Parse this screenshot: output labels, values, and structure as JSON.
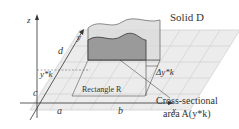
{
  "diagram": {
    "title": "Solid D",
    "axes": {
      "z": "z",
      "y": "y",
      "x": "x"
    },
    "ticks": {
      "a": "a",
      "b": "b",
      "c": "c",
      "d": "d"
    },
    "yk_label": "y*k",
    "delta_label": "Δy*k",
    "rectangle_label": "Rectangle R",
    "cross_section_label_line1": "Cross-sectional",
    "cross_section_label_line2": "area A(y*k)",
    "colors": {
      "grid_fill": "#e8e8e8",
      "grid_line": "#bfbfbf",
      "solid_fill": "#a9a9a9",
      "solid_top": "#d9d9d9",
      "line": "#333333"
    }
  }
}
